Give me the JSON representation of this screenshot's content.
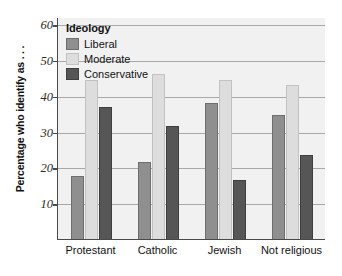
{
  "chart_data": {
    "type": "bar",
    "title": "",
    "xlabel": "",
    "ylabel": "Percentage who identify as . . .",
    "categories": [
      "Protestant",
      "Catholic",
      "Jewish",
      "Not religious"
    ],
    "series": [
      {
        "name": "Liberal",
        "color": "#8f8f8f",
        "values": [
          17.5,
          21.5,
          38.0,
          34.5
        ]
      },
      {
        "name": "Moderate",
        "color": "#dddddd",
        "values": [
          44.5,
          46.0,
          44.5,
          43.0
        ]
      },
      {
        "name": "Conservative",
        "color": "#565656",
        "values": [
          37.0,
          31.5,
          16.5,
          23.5
        ]
      }
    ],
    "ylim": [
      0,
      62
    ],
    "yticks": [
      10,
      20,
      30,
      40,
      50,
      60
    ],
    "grid": true,
    "legend": {
      "title": "Ideology",
      "position": "top-left",
      "entries": [
        "Liberal",
        "Moderate",
        "Conservative"
      ]
    }
  }
}
